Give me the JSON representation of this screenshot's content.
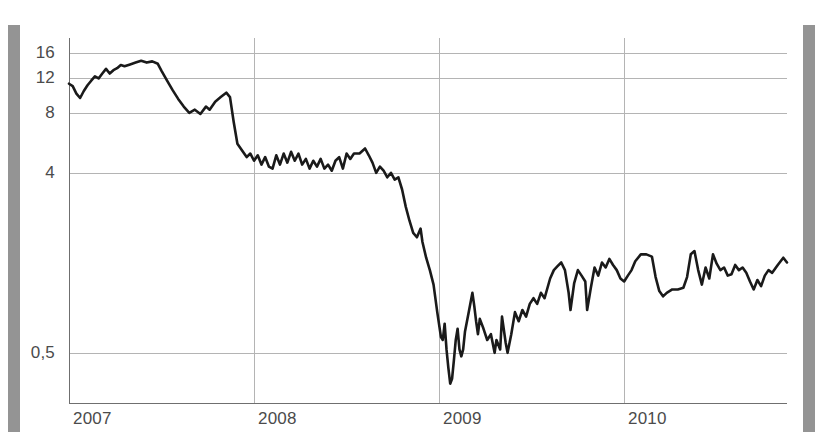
{
  "chart_data": {
    "type": "line",
    "title": "",
    "subtitle": "",
    "xlabel": "",
    "ylabel": "",
    "yscale": "log",
    "ylim": [
      0.28,
      19
    ],
    "xlim": [
      2007.0,
      2010.88
    ],
    "grid": true,
    "legend": "none",
    "y_ticks": [
      {
        "value": 16,
        "label": "16"
      },
      {
        "value": 12,
        "label": "12"
      },
      {
        "value": 8,
        "label": "8"
      },
      {
        "value": 4,
        "label": "4"
      },
      {
        "value": 0.5,
        "label": "0,5"
      }
    ],
    "x_ticks": [
      {
        "value": 2007,
        "label": "2007"
      },
      {
        "value": 2008,
        "label": "2008"
      },
      {
        "value": 2009,
        "label": "2009"
      },
      {
        "value": 2010,
        "label": "2010"
      }
    ],
    "line_color": "#1a1a1a",
    "grid_color": "#b4b4b4",
    "axis_color": "#6f6f6f",
    "series": [
      {
        "name": "series-1",
        "points": [
          [
            2007.0,
            11.2
          ],
          [
            2007.02,
            10.9
          ],
          [
            2007.04,
            10.0
          ],
          [
            2007.06,
            9.5
          ],
          [
            2007.08,
            10.3
          ],
          [
            2007.1,
            11.0
          ],
          [
            2007.12,
            11.6
          ],
          [
            2007.14,
            12.2
          ],
          [
            2007.16,
            11.9
          ],
          [
            2007.18,
            12.6
          ],
          [
            2007.2,
            13.3
          ],
          [
            2007.22,
            12.6
          ],
          [
            2007.24,
            13.1
          ],
          [
            2007.26,
            13.4
          ],
          [
            2007.28,
            13.9
          ],
          [
            2007.3,
            13.7
          ],
          [
            2007.33,
            14.0
          ],
          [
            2007.36,
            14.3
          ],
          [
            2007.39,
            14.6
          ],
          [
            2007.42,
            14.3
          ],
          [
            2007.45,
            14.5
          ],
          [
            2007.48,
            14.1
          ],
          [
            2007.5,
            13.0
          ],
          [
            2007.53,
            11.6
          ],
          [
            2007.56,
            10.4
          ],
          [
            2007.59,
            9.4
          ],
          [
            2007.62,
            8.6
          ],
          [
            2007.65,
            8.0
          ],
          [
            2007.68,
            8.3
          ],
          [
            2007.71,
            7.9
          ],
          [
            2007.74,
            8.6
          ],
          [
            2007.76,
            8.3
          ],
          [
            2007.79,
            9.1
          ],
          [
            2007.82,
            9.6
          ],
          [
            2007.85,
            10.1
          ],
          [
            2007.87,
            9.6
          ],
          [
            2007.89,
            7.2
          ],
          [
            2007.91,
            5.6
          ],
          [
            2007.94,
            5.1
          ],
          [
            2007.96,
            4.8
          ],
          [
            2007.98,
            5.0
          ],
          [
            2008.0,
            4.6
          ],
          [
            2008.02,
            4.9
          ],
          [
            2008.04,
            4.4
          ],
          [
            2008.06,
            4.8
          ],
          [
            2008.08,
            4.3
          ],
          [
            2008.1,
            4.2
          ],
          [
            2008.12,
            4.9
          ],
          [
            2008.14,
            4.4
          ],
          [
            2008.16,
            5.0
          ],
          [
            2008.18,
            4.5
          ],
          [
            2008.2,
            5.1
          ],
          [
            2008.22,
            4.6
          ],
          [
            2008.24,
            5.0
          ],
          [
            2008.26,
            4.4
          ],
          [
            2008.28,
            4.7
          ],
          [
            2008.3,
            4.2
          ],
          [
            2008.32,
            4.6
          ],
          [
            2008.34,
            4.3
          ],
          [
            2008.36,
            4.7
          ],
          [
            2008.38,
            4.2
          ],
          [
            2008.4,
            4.4
          ],
          [
            2008.42,
            4.1
          ],
          [
            2008.44,
            4.6
          ],
          [
            2008.46,
            4.8
          ],
          [
            2008.48,
            4.2
          ],
          [
            2008.5,
            5.0
          ],
          [
            2008.52,
            4.7
          ],
          [
            2008.54,
            5.0
          ],
          [
            2008.57,
            5.0
          ],
          [
            2008.6,
            5.3
          ],
          [
            2008.62,
            4.9
          ],
          [
            2008.64,
            4.5
          ],
          [
            2008.66,
            4.0
          ],
          [
            2008.68,
            4.3
          ],
          [
            2008.7,
            4.1
          ],
          [
            2008.72,
            3.8
          ],
          [
            2008.74,
            4.0
          ],
          [
            2008.76,
            3.7
          ],
          [
            2008.78,
            3.8
          ],
          [
            2008.8,
            3.3
          ],
          [
            2008.82,
            2.7
          ],
          [
            2008.84,
            2.3
          ],
          [
            2008.86,
            2.0
          ],
          [
            2008.88,
            1.9
          ],
          [
            2008.9,
            2.1
          ],
          [
            2008.91,
            1.8
          ],
          [
            2008.93,
            1.5
          ],
          [
            2008.95,
            1.3
          ],
          [
            2008.97,
            1.1
          ],
          [
            2008.99,
            0.8
          ],
          [
            2009.01,
            0.6
          ],
          [
            2009.02,
            0.58
          ],
          [
            2009.03,
            0.7
          ],
          [
            2009.04,
            0.52
          ],
          [
            2009.05,
            0.42
          ],
          [
            2009.06,
            0.35
          ],
          [
            2009.07,
            0.37
          ],
          [
            2009.08,
            0.46
          ],
          [
            2009.09,
            0.58
          ],
          [
            2009.1,
            0.66
          ],
          [
            2009.11,
            0.52
          ],
          [
            2009.12,
            0.48
          ],
          [
            2009.13,
            0.52
          ],
          [
            2009.14,
            0.64
          ],
          [
            2009.16,
            0.8
          ],
          [
            2009.18,
            1.0
          ],
          [
            2009.19,
            0.86
          ],
          [
            2009.2,
            0.72
          ],
          [
            2009.21,
            0.62
          ],
          [
            2009.22,
            0.74
          ],
          [
            2009.24,
            0.66
          ],
          [
            2009.26,
            0.58
          ],
          [
            2009.28,
            0.62
          ],
          [
            2009.3,
            0.5
          ],
          [
            2009.31,
            0.58
          ],
          [
            2009.33,
            0.52
          ],
          [
            2009.34,
            0.76
          ],
          [
            2009.36,
            0.56
          ],
          [
            2009.37,
            0.5
          ],
          [
            2009.39,
            0.62
          ],
          [
            2009.41,
            0.8
          ],
          [
            2009.43,
            0.72
          ],
          [
            2009.45,
            0.82
          ],
          [
            2009.47,
            0.76
          ],
          [
            2009.49,
            0.88
          ],
          [
            2009.51,
            0.94
          ],
          [
            2009.53,
            0.88
          ],
          [
            2009.55,
            1.0
          ],
          [
            2009.57,
            0.94
          ],
          [
            2009.6,
            1.18
          ],
          [
            2009.62,
            1.3
          ],
          [
            2009.64,
            1.36
          ],
          [
            2009.66,
            1.42
          ],
          [
            2009.68,
            1.3
          ],
          [
            2009.7,
            1.0
          ],
          [
            2009.71,
            0.82
          ],
          [
            2009.73,
            1.12
          ],
          [
            2009.75,
            1.3
          ],
          [
            2009.77,
            1.22
          ],
          [
            2009.79,
            1.14
          ],
          [
            2009.8,
            0.82
          ],
          [
            2009.82,
            1.06
          ],
          [
            2009.84,
            1.34
          ],
          [
            2009.86,
            1.22
          ],
          [
            2009.88,
            1.42
          ],
          [
            2009.9,
            1.34
          ],
          [
            2009.92,
            1.48
          ],
          [
            2009.94,
            1.38
          ],
          [
            2009.96,
            1.3
          ],
          [
            2009.98,
            1.18
          ],
          [
            2010.0,
            1.14
          ],
          [
            2010.02,
            1.22
          ],
          [
            2010.04,
            1.3
          ],
          [
            2010.06,
            1.44
          ],
          [
            2010.09,
            1.56
          ],
          [
            2010.12,
            1.56
          ],
          [
            2010.15,
            1.52
          ],
          [
            2010.17,
            1.2
          ],
          [
            2010.19,
            1.02
          ],
          [
            2010.21,
            0.96
          ],
          [
            2010.23,
            1.0
          ],
          [
            2010.26,
            1.04
          ],
          [
            2010.29,
            1.04
          ],
          [
            2010.32,
            1.06
          ],
          [
            2010.34,
            1.2
          ],
          [
            2010.36,
            1.56
          ],
          [
            2010.38,
            1.62
          ],
          [
            2010.4,
            1.3
          ],
          [
            2010.42,
            1.1
          ],
          [
            2010.44,
            1.34
          ],
          [
            2010.46,
            1.18
          ],
          [
            2010.48,
            1.56
          ],
          [
            2010.5,
            1.4
          ],
          [
            2010.52,
            1.3
          ],
          [
            2010.54,
            1.34
          ],
          [
            2010.56,
            1.22
          ],
          [
            2010.58,
            1.24
          ],
          [
            2010.6,
            1.38
          ],
          [
            2010.62,
            1.3
          ],
          [
            2010.64,
            1.34
          ],
          [
            2010.66,
            1.26
          ],
          [
            2010.68,
            1.14
          ],
          [
            2010.7,
            1.04
          ],
          [
            2010.72,
            1.16
          ],
          [
            2010.74,
            1.08
          ],
          [
            2010.76,
            1.22
          ],
          [
            2010.78,
            1.3
          ],
          [
            2010.8,
            1.26
          ],
          [
            2010.83,
            1.38
          ],
          [
            2010.86,
            1.5
          ],
          [
            2010.88,
            1.42
          ]
        ]
      }
    ]
  },
  "decorations": {
    "scanbar_color": "#8e8e8e"
  }
}
